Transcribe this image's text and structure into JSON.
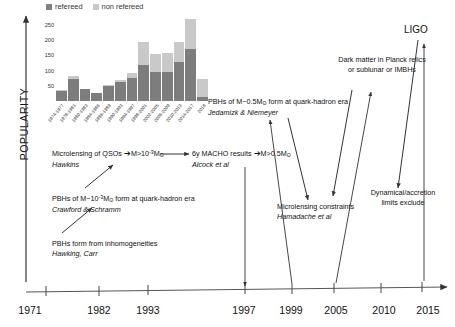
{
  "axis_label": "POPULARITY",
  "ligo_label": "LIGO",
  "chart_data": {
    "type": "bar",
    "stacked": true,
    "title": "",
    "xlabel": "",
    "ylabel": "",
    "ylim": [
      0,
      290
    ],
    "yticks": [
      50,
      100,
      150,
      200,
      250
    ],
    "grid": false,
    "legend_position": "top-left",
    "categories": [
      "1974-1977",
      "1978-1981",
      "1980-1983",
      "1984-1986",
      "1986-1989",
      "1990-1993",
      "1994-1997",
      "1998-2001",
      "2002-2005",
      "2006-2009",
      "2010-2013",
      "2014-2017",
      "2018"
    ],
    "series": [
      {
        "name": "refereed",
        "color": "#7d7d7d",
        "values": [
          33,
          73,
          38,
          25,
          48,
          62,
          75,
          120,
          97,
          97,
          130,
          172,
          12
        ]
      },
      {
        "name": "non refereed",
        "color": "#c9c9c9",
        "values": [
          2,
          9,
          2,
          3,
          4,
          8,
          18,
          73,
          58,
          62,
          65,
          98,
          62
        ]
      }
    ]
  },
  "timeline": {
    "years": [
      {
        "label": "1971",
        "x": 30
      },
      {
        "label": "1982",
        "x": 99
      },
      {
        "label": "1993",
        "x": 148
      },
      {
        "label": "1997",
        "x": 244
      },
      {
        "label": "1999",
        "x": 291
      },
      {
        "label": "2005",
        "x": 336
      },
      {
        "label": "2010",
        "x": 384
      },
      {
        "label": "2015",
        "x": 428
      }
    ]
  },
  "annotations": [
    {
      "id": "pbh-inhomogeneities",
      "text": "PBHs form from inhomogeneities",
      "author": "Hawking, Carr"
    },
    {
      "id": "pbh-quark-hadron-crawford",
      "text_pre": "PBHs of M~10",
      "text_exp": "-3",
      "text_mid": "M",
      "text_sub": "ʘ",
      "text_post": "form at quark-hadron  era",
      "author": "Crawford & Schramm"
    },
    {
      "id": "microlensing-qsos",
      "text_pre": "Microlensing of QSOs ",
      "arrow": "➔",
      "text_post_pre": "M>10",
      "text_exp": "-3",
      "text_mid": "M",
      "text_sub": "ʘ",
      "author": "Hawkins"
    },
    {
      "id": "macho-results",
      "text_pre": "6y MACHO results ",
      "arrow": "➔",
      "text_post_pre": "M>0.5M",
      "text_sub": "ʘ",
      "author": "Alcock et al"
    },
    {
      "id": "pbh-half-solar-mass",
      "text_pre": "PBHs of M~0.5M",
      "text_sub": "ʘ",
      "text_post": " form at quark-hadron  era",
      "author": "Jedamizk & Niemeyer"
    },
    {
      "id": "microlensing-constraints",
      "text": "Microlensing constraints",
      "author": "Hamadache et al"
    },
    {
      "id": "dark-matter-planck-relics",
      "line1": "Dark  matter in Planck relics",
      "line2": "or sublunar or IMBHs"
    },
    {
      "id": "dynamical-accretion-limits",
      "line1": "Dynamical/accretion",
      "line2": "limits exclude"
    }
  ]
}
